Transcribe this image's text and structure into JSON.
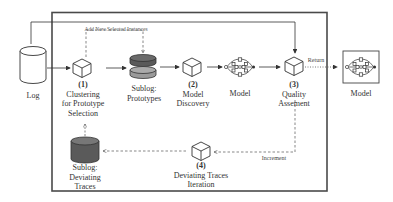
{
  "diagram": {
    "colors": {
      "frame": "#4a4a4a",
      "line": "#333333",
      "dashed": "#555555",
      "cylinder_dark": "#5a5a5a",
      "cylinder_light": "#9a9a9a"
    },
    "nodes": {
      "log": {
        "label": "Log"
      },
      "step1": {
        "number": "(1)",
        "line1": "Clustering",
        "line2": "for Prototype",
        "line3": "Selection"
      },
      "sublog_prototypes": {
        "line1": "Sublog:",
        "line2": "Prototypes"
      },
      "step2": {
        "number": "(2)",
        "line1": "Model",
        "line2": "Discovery"
      },
      "model_inner": {
        "label": "Model"
      },
      "step3": {
        "number": "(3)",
        "line1": "Quality",
        "line2": "Assement"
      },
      "model_output": {
        "label": "Model"
      },
      "step4": {
        "number": "(4)",
        "line1": "Deviating Traces",
        "line2": "Iteration"
      },
      "sublog_deviating": {
        "line1": "Sublog:",
        "line2": "Deviating",
        "line3": "Traces"
      }
    },
    "edge_labels": {
      "add_new": "Add New Selected Instances",
      "return": "Return",
      "increment": "Increment"
    }
  }
}
